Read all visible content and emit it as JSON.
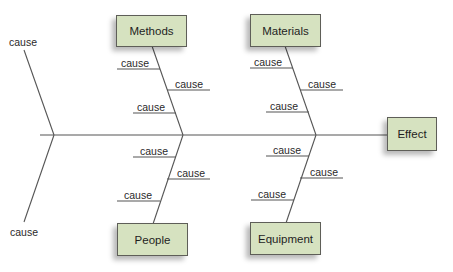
{
  "diagram": {
    "type": "fishbone",
    "effect": "Effect",
    "categories": [
      {
        "name": "Methods",
        "position": "top",
        "causes": [
          "cause",
          "cause",
          "cause"
        ]
      },
      {
        "name": "Materials",
        "position": "top",
        "causes": [
          "cause",
          "cause",
          "cause"
        ]
      },
      {
        "name": "People",
        "position": "bottom",
        "causes": [
          "cause",
          "cause",
          "cause"
        ]
      },
      {
        "name": "Equipment",
        "position": "bottom",
        "causes": [
          "cause",
          "cause",
          "cause"
        ]
      }
    ],
    "tail_causes": [
      "cause",
      "cause"
    ],
    "colors": {
      "box_fill": "#d6e2c0",
      "box_border": "#5e5e58",
      "line": "#555555"
    }
  }
}
